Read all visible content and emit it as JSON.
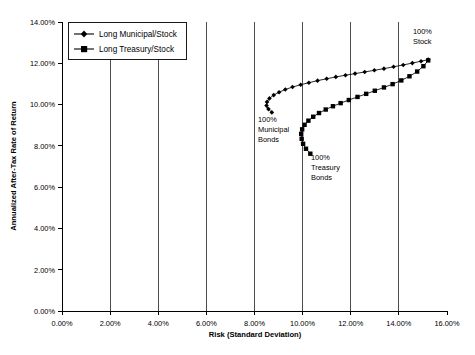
{
  "chart_data": {
    "type": "line",
    "title": "",
    "xlabel": "Risk (Standard Deviation)",
    "ylabel": "Annualized After-Tax Rate of Return",
    "xlim": [
      0,
      16
    ],
    "ylim": [
      0,
      14
    ],
    "xticks": [
      "0.00%",
      "2.00%",
      "4.00%",
      "6.00%",
      "8.00%",
      "10.00%",
      "12.00%",
      "14.00%",
      "16.00%"
    ],
    "xtick_values": [
      0,
      2,
      4,
      6,
      8,
      10,
      12,
      14,
      16
    ],
    "yticks": [
      "0.00%",
      "2.00%",
      "4.00%",
      "6.00%",
      "8.00%",
      "10.00%",
      "12.00%",
      "14.00%"
    ],
    "ytick_values": [
      0,
      2,
      4,
      6,
      8,
      10,
      12,
      14
    ],
    "grid": "vertical-only",
    "legend_position": "top-left",
    "series": [
      {
        "name": "Long Municipal/Stock",
        "marker": "diamond",
        "color": "#000000",
        "points": [
          [
            8.72,
            9.62
          ],
          [
            8.58,
            9.78
          ],
          [
            8.5,
            9.95
          ],
          [
            8.52,
            10.13
          ],
          [
            8.62,
            10.3
          ],
          [
            8.8,
            10.46
          ],
          [
            9.02,
            10.6
          ],
          [
            9.28,
            10.73
          ],
          [
            9.58,
            10.85
          ],
          [
            9.92,
            10.96
          ],
          [
            10.26,
            11.06
          ],
          [
            10.62,
            11.16
          ],
          [
            11.0,
            11.25
          ],
          [
            11.38,
            11.34
          ],
          [
            11.78,
            11.42
          ],
          [
            12.18,
            11.5
          ],
          [
            12.58,
            11.58
          ],
          [
            12.98,
            11.66
          ],
          [
            13.38,
            11.74
          ],
          [
            13.78,
            11.83
          ],
          [
            14.18,
            11.92
          ],
          [
            14.56,
            12.01
          ],
          [
            14.92,
            12.1
          ],
          [
            15.22,
            12.18
          ]
        ]
      },
      {
        "name": "Long Treasury/Stock",
        "marker": "square",
        "color": "#000000",
        "points": [
          [
            10.32,
            7.62
          ],
          [
            10.14,
            7.86
          ],
          [
            10.02,
            8.1
          ],
          [
            9.96,
            8.34
          ],
          [
            9.94,
            8.58
          ],
          [
            9.98,
            8.8
          ],
          [
            10.08,
            9.02
          ],
          [
            10.24,
            9.22
          ],
          [
            10.44,
            9.41
          ],
          [
            10.68,
            9.59
          ],
          [
            10.96,
            9.76
          ],
          [
            11.26,
            9.92
          ],
          [
            11.58,
            10.07
          ],
          [
            11.92,
            10.22
          ],
          [
            12.28,
            10.37
          ],
          [
            12.64,
            10.52
          ],
          [
            13.0,
            10.67
          ],
          [
            13.38,
            10.83
          ],
          [
            13.74,
            10.99
          ],
          [
            14.1,
            11.17
          ],
          [
            14.44,
            11.37
          ],
          [
            14.76,
            11.6
          ],
          [
            15.02,
            11.86
          ],
          [
            15.22,
            12.14
          ]
        ]
      }
    ],
    "annotations": [
      {
        "text": "100% Stock",
        "lines": [
          "100%",
          "Stock"
        ],
        "x": 15.22,
        "y": 12.18
      },
      {
        "text": "100% Municipal Bonds",
        "lines": [
          "100%",
          "Municipal",
          "Bonds"
        ],
        "x": 8.72,
        "y": 9.62
      },
      {
        "text": "100% Treasury Bonds",
        "lines": [
          "100%",
          "Treasury",
          "Bonds"
        ],
        "x": 10.32,
        "y": 7.62
      }
    ]
  },
  "legend": {
    "items": [
      {
        "label": "Long Municipal/Stock",
        "marker": "diamond"
      },
      {
        "label": "Long Treasury/Stock",
        "marker": "square"
      }
    ]
  },
  "axes": {
    "x_title": "Risk (Standard Deviation)",
    "y_title": "Annualized After-Tax Rate of Return"
  },
  "labels": {
    "x0": "0.00%",
    "x1": "2.00%",
    "x2": "4.00%",
    "x3": "6.00%",
    "x4": "8.00%",
    "x5": "10.00%",
    "x6": "12.00%",
    "x7": "14.00%",
    "x8": "16.00%",
    "y0": "0.00%",
    "y1": "2.00%",
    "y2": "4.00%",
    "y3": "6.00%",
    "y4": "8.00%",
    "y5": "10.00%",
    "y6": "12.00%",
    "y7": "14.00%"
  },
  "annotation_text": {
    "stock_l1": "100%",
    "stock_l2": "Stock",
    "muni_l1": "100%",
    "muni_l2": "Municipal",
    "muni_l3": "Bonds",
    "treas_l1": "100%",
    "treas_l2": "Treasury",
    "treas_l3": "Bonds"
  }
}
